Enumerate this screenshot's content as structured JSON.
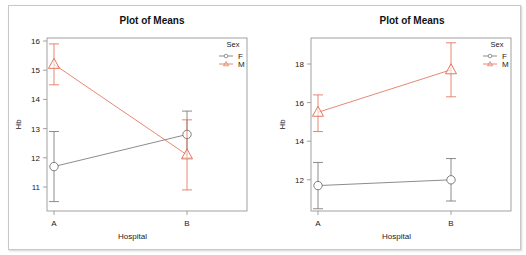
{
  "colors": {
    "F": "#6e6e6e",
    "M": "#e06a50",
    "axis": "#8a8a8a"
  },
  "chart_data": [
    {
      "type": "line",
      "title": "Plot of Means",
      "xlabel": "Hospital",
      "ylabel": "Hb",
      "categories": [
        "A",
        "B"
      ],
      "yticks": [
        11,
        12,
        13,
        14,
        15,
        16
      ],
      "ylim": [
        10.2,
        16.1
      ],
      "legend": {
        "title": "Sex",
        "position": "top-right",
        "entries": [
          "F",
          "M"
        ]
      },
      "grid": false,
      "series": [
        {
          "name": "F",
          "marker": "circle",
          "values": [
            11.7,
            12.8
          ],
          "lower": [
            10.5,
            12.0
          ],
          "upper": [
            12.9,
            13.6
          ]
        },
        {
          "name": "M",
          "marker": "triangle",
          "values": [
            15.2,
            12.1
          ],
          "lower": [
            14.5,
            10.9
          ],
          "upper": [
            15.9,
            13.3
          ]
        }
      ]
    },
    {
      "type": "line",
      "title": "Plot of Means",
      "xlabel": "Hospital",
      "ylabel": "Hb",
      "categories": [
        "A",
        "B"
      ],
      "yticks": [
        12,
        14,
        16,
        18
      ],
      "ylim": [
        10.4,
        19.4
      ],
      "legend": {
        "title": "Sex",
        "position": "top-right",
        "entries": [
          "F",
          "M"
        ]
      },
      "grid": false,
      "series": [
        {
          "name": "F",
          "marker": "circle",
          "values": [
            11.7,
            12.0
          ],
          "lower": [
            10.5,
            10.9
          ],
          "upper": [
            12.9,
            13.1
          ]
        },
        {
          "name": "M",
          "marker": "triangle",
          "values": [
            15.5,
            17.7
          ],
          "lower": [
            14.5,
            16.3
          ],
          "upper": [
            16.4,
            19.1
          ]
        }
      ]
    }
  ]
}
